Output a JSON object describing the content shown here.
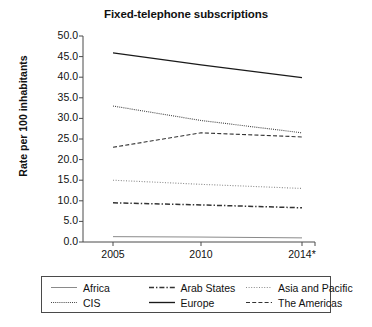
{
  "chart_data": {
    "type": "line",
    "title": "Fixed-telephone subscriptions",
    "xlabel": "",
    "ylabel": "Rate per 100 inhabitants",
    "categories": [
      "2005",
      "2010",
      "2014*"
    ],
    "ylim": [
      0.0,
      50.0
    ],
    "ytick_labels": [
      "0.0",
      "5.0",
      "10.0",
      "15.0",
      "20.0",
      "25.0",
      "30.0",
      "35.0",
      "40.0",
      "45.0",
      "50.0"
    ],
    "ytick_values": [
      0.0,
      5.0,
      10.0,
      15.0,
      20.0,
      25.0,
      30.0,
      35.0,
      40.0,
      45.0,
      50.0
    ],
    "grid": false,
    "legend_position": "below",
    "series": [
      {
        "name": "Africa",
        "values": [
          1.3,
          1.2,
          1.0
        ],
        "style": "solid-light",
        "color": "#8a8a8a"
      },
      {
        "name": "Arab States",
        "values": [
          9.5,
          9.0,
          8.3
        ],
        "style": "dash-dot",
        "color": "#333333"
      },
      {
        "name": "Asia and Pacific",
        "values": [
          15.0,
          14.0,
          13.0
        ],
        "style": "dotted",
        "color": "#8a8a8a"
      },
      {
        "name": "CIS",
        "values": [
          33.0,
          29.5,
          26.5
        ],
        "style": "dotted-dense",
        "color": "#444444"
      },
      {
        "name": "Europe",
        "values": [
          45.9,
          43.0,
          39.9
        ],
        "style": "solid",
        "color": "#1a1a1a"
      },
      {
        "name": "The Americas",
        "values": [
          23.0,
          26.5,
          25.5
        ],
        "style": "dashed",
        "color": "#333333"
      }
    ]
  },
  "legend": {
    "rows": [
      [
        "Africa",
        "Arab States",
        "Asia and Pacific"
      ],
      [
        "CIS",
        "Europe",
        "The Americas"
      ]
    ]
  },
  "colors": {
    "axis": "#4a4a4a",
    "text": "#111111",
    "background": "#ffffff"
  }
}
